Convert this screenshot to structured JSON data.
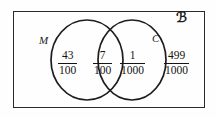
{
  "diagram": {
    "type": "venn-two-set",
    "universe_label": "ℬ",
    "universe_symbol_name": "fraktur-u-universal-set",
    "sets": [
      {
        "id": "M",
        "label": "M",
        "position": "left"
      },
      {
        "id": "C",
        "label": "C",
        "position": "right"
      }
    ],
    "regions": [
      {
        "id": "m-only",
        "description": "M only",
        "numerator": "43",
        "denominator": "100"
      },
      {
        "id": "both",
        "description": "M and C",
        "numerator": "7",
        "denominator": "100"
      },
      {
        "id": "c-only",
        "description": "C only",
        "numerator": "1",
        "denominator": "1000"
      },
      {
        "id": "outside",
        "description": "Outside M and C",
        "numerator": "499",
        "denominator": "1000"
      }
    ],
    "colors": {
      "stroke": "#1d1d1d",
      "text": "#141414",
      "background": "#fefefe"
    }
  }
}
